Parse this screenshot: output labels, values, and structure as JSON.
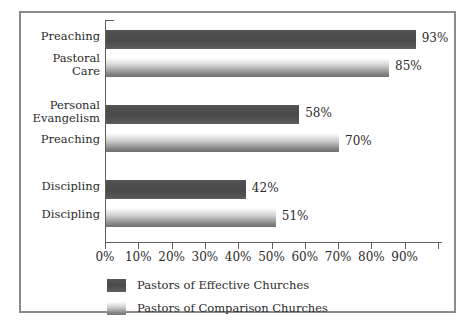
{
  "chart_data": {
    "type": "bar",
    "orientation": "horizontal",
    "title": "",
    "subtitle": "",
    "xlabel": "",
    "ylabel": "",
    "xlim": [
      0,
      100
    ],
    "grid": false,
    "legend_position": "bottom-left",
    "xticks": [
      "0%",
      "10%",
      "20%",
      "30%",
      "40%",
      "50%",
      "60%",
      "70%",
      "80%",
      "90%"
    ],
    "xtick_values": [
      0,
      10,
      20,
      30,
      40,
      50,
      60,
      70,
      80,
      90
    ],
    "legend": [
      {
        "name": "Pastors of Effective Churches",
        "swatch": "dark",
        "color": "#4a4a4a"
      },
      {
        "name": "Pastors of Comparison Churches",
        "swatch": "light",
        "color": "#b0b0b0"
      }
    ],
    "groups": [
      {
        "bars": [
          {
            "label": "Preaching",
            "series": "Pastors of Effective Churches",
            "value": 93,
            "value_label": "93%"
          },
          {
            "label": "Pastoral\nCare",
            "series": "Pastors of Comparison Churches",
            "value": 85,
            "value_label": "85%"
          }
        ]
      },
      {
        "bars": [
          {
            "label": "Personal\nEvangelism",
            "series": "Pastors of Effective Churches",
            "value": 58,
            "value_label": "58%"
          },
          {
            "label": "Preaching",
            "series": "Pastors of Comparison Churches",
            "value": 70,
            "value_label": "70%"
          }
        ]
      },
      {
        "bars": [
          {
            "label": "Discipling",
            "series": "Pastors of Effective Churches",
            "value": 42,
            "value_label": "42%"
          },
          {
            "label": "Discipling",
            "series": "Pastors of Comparison Churches",
            "value": 51,
            "value_label": "51%"
          }
        ]
      }
    ],
    "rows": [
      {
        "label": "Preaching",
        "two_line": false,
        "series": "dark",
        "value": 93,
        "value_label": "93%"
      },
      {
        "label": "Pastoral\nCare",
        "two_line": true,
        "series": "light",
        "value": 85,
        "value_label": "85%"
      },
      {
        "label": "Personal\nEvangelism",
        "two_line": true,
        "series": "dark",
        "value": 58,
        "value_label": "58%"
      },
      {
        "label": "Preaching",
        "two_line": false,
        "series": "light",
        "value": 70,
        "value_label": "70%"
      },
      {
        "label": "Discipling",
        "two_line": false,
        "series": "dark",
        "value": 42,
        "value_label": "42%"
      },
      {
        "label": "Discipling",
        "two_line": false,
        "series": "light",
        "value": 51,
        "value_label": "51%"
      }
    ],
    "colors": {
      "bar_dark": "#4a4a4a",
      "bar_light": "#b0b0b0",
      "axis": "#5e5e5e",
      "border": "#8c8c8c",
      "text": "#2b2b2b",
      "background": "#ffffff"
    }
  }
}
